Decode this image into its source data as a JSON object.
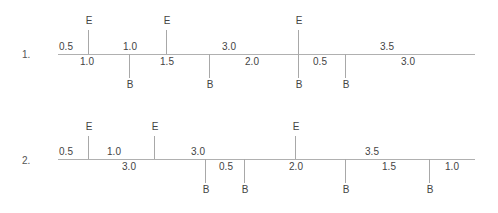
{
  "rows": [
    {
      "label": "1.",
      "events_E": [
        "E",
        "E",
        "E"
      ],
      "events_B": [
        "B",
        "B",
        "B",
        "B"
      ],
      "above": [
        "0.5",
        "1.0",
        "3.0",
        "3.5"
      ],
      "below": [
        "1.0",
        "1.5",
        "2.0",
        "0.5",
        "3.0"
      ]
    },
    {
      "label": "2.",
      "events_E": [
        "E",
        "E",
        "E"
      ],
      "events_B": [
        "B",
        "B",
        "B",
        "B"
      ],
      "above": [
        "0.5",
        "1.0",
        "3.0",
        "3.5"
      ],
      "below": [
        "3.0",
        "0.5",
        "2.0",
        "1.5",
        "1.0"
      ]
    }
  ]
}
